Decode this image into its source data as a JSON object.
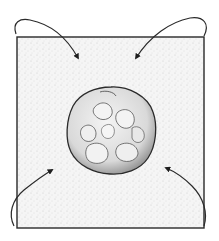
{
  "figure": {
    "description": "Square sheet with a lumpy round ball at center; four curved arrows indicating corners folding toward the center",
    "colors": {
      "background": "#ffffff",
      "sheet_fill": "#f4f4f4",
      "sheet_stipple": "#bdbdbd",
      "ink": "#2a2a2a",
      "ball_fill": "#e6e6e6",
      "ball_shadow": "#7a7a7a"
    },
    "sheet": {
      "x": 17,
      "y": 37,
      "width": 187,
      "height": 191
    },
    "ball": {
      "cx": 111,
      "cy": 130,
      "rx": 44,
      "ry": 44
    },
    "arrows": [
      {
        "id": "top-left",
        "direction": "corner-to-center"
      },
      {
        "id": "top-right",
        "direction": "corner-to-center"
      },
      {
        "id": "bottom-left",
        "direction": "corner-to-center"
      },
      {
        "id": "bottom-right",
        "direction": "corner-to-center"
      }
    ]
  }
}
